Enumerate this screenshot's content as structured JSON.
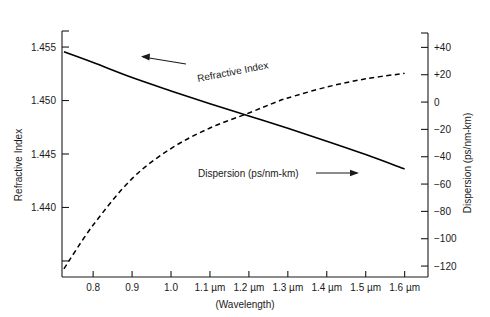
{
  "chart_data": {
    "type": "line",
    "title": "",
    "xlabel": "(Wavelength)",
    "xlim": [
      0.72,
      1.66
    ],
    "grid": false,
    "legend_position": "inline-annotations",
    "x_ticks": [
      {
        "value": 0.8,
        "label": "0.8"
      },
      {
        "value": 0.9,
        "label": "0.9"
      },
      {
        "value": 1.0,
        "label": "1.0"
      },
      {
        "value": 1.1,
        "label": "1.1 µm"
      },
      {
        "value": 1.2,
        "label": "1.2 µm"
      },
      {
        "value": 1.3,
        "label": "1.3 µm"
      },
      {
        "value": 1.4,
        "label": "1.4 µm"
      },
      {
        "value": 1.5,
        "label": "1.5 µm"
      },
      {
        "value": 1.6,
        "label": "1.6 µm"
      }
    ],
    "left_axis": {
      "label": "Refractive Index",
      "lim": [
        1.4335,
        1.4565
      ],
      "ticks": [
        {
          "value": 1.455,
          "label": "1.455"
        },
        {
          "value": 1.45,
          "label": "1.450"
        },
        {
          "value": 1.445,
          "label": "1.445"
        },
        {
          "value": 1.44,
          "label": "1.440"
        },
        {
          "value": 1.435,
          "label": ""
        }
      ]
    },
    "right_axis": {
      "label": "Dispersion (ps/nm-km)",
      "lim": [
        -128,
        52
      ],
      "ticks": [
        {
          "value": 40,
          "label": "+40"
        },
        {
          "value": 20,
          "label": "+20"
        },
        {
          "value": 0,
          "label": "0"
        },
        {
          "value": -20,
          "label": "−20"
        },
        {
          "value": -40,
          "label": "−40"
        },
        {
          "value": -60,
          "label": "−60"
        },
        {
          "value": -80,
          "label": "−80"
        },
        {
          "value": -100,
          "label": "−100"
        },
        {
          "value": -120,
          "label": "−120"
        }
      ]
    },
    "series": [
      {
        "name": "Refractive Index",
        "axis": "left",
        "style": "solid",
        "color": "#000000",
        "annotation": "Refractive Index",
        "arrow": "left",
        "x": [
          0.725,
          0.8,
          0.9,
          1.0,
          1.1,
          1.2,
          1.3,
          1.4,
          1.5,
          1.6
        ],
        "y": [
          1.45455,
          1.45355,
          1.45215,
          1.4509,
          1.4497,
          1.44855,
          1.4474,
          1.4462,
          1.44495,
          1.4436
        ]
      },
      {
        "name": "Dispersion (ps/nm-km)",
        "axis": "right",
        "style": "dashed",
        "color": "#000000",
        "annotation": "Dispersion (ps/nm-km)",
        "arrow": "right",
        "x": [
          0.725,
          0.8,
          0.9,
          1.0,
          1.1,
          1.2,
          1.27,
          1.3,
          1.4,
          1.5,
          1.6
        ],
        "y": [
          -122,
          -90,
          -56,
          -34,
          -19,
          -8,
          0,
          3,
          11,
          17,
          21
        ]
      }
    ],
    "annotations": [
      {
        "text": "Refractive Index",
        "x": 1.06,
        "y_left": 1.4502,
        "rotation": -10
      },
      {
        "text": "Dispersion (ps/nm-km)",
        "x": 1.12,
        "y_right": -44,
        "rotation": 0
      }
    ]
  }
}
